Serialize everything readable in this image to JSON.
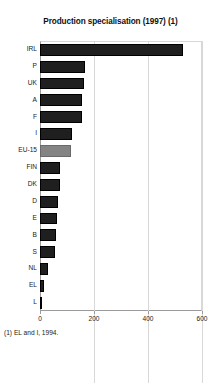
{
  "chart_data": {
    "type": "bar",
    "orientation": "horizontal",
    "title": "Production specialisation (1997) (1)",
    "xlabel": "",
    "ylabel": "",
    "xlim": [
      0,
      600
    ],
    "xticks": [
      0,
      200,
      400,
      600
    ],
    "xticklabels": [
      "0",
      "200",
      "400",
      "600"
    ],
    "grid": true,
    "legend": null,
    "categories": [
      "IRL",
      "P",
      "UK",
      "A",
      "F",
      "I",
      "EU-15",
      "FIN",
      "DK",
      "D",
      "E",
      "B",
      "S",
      "NL",
      "EL",
      "L"
    ],
    "values": [
      530,
      167,
      163,
      156,
      156,
      119,
      115,
      74,
      74,
      67,
      63,
      59,
      56,
      30,
      15,
      4
    ],
    "highlight_category": "EU-15",
    "colors": {
      "bar": "#1f1f1f",
      "bar_highlight": "#848484",
      "grid": "#d8d8d8",
      "axis": "#9a9a9a",
      "text": "#1a1a1a",
      "background": "#ffffff"
    },
    "annotations": [
      "(1) EL and I, 1994."
    ]
  },
  "footnote": "(1) EL and I, 1994."
}
